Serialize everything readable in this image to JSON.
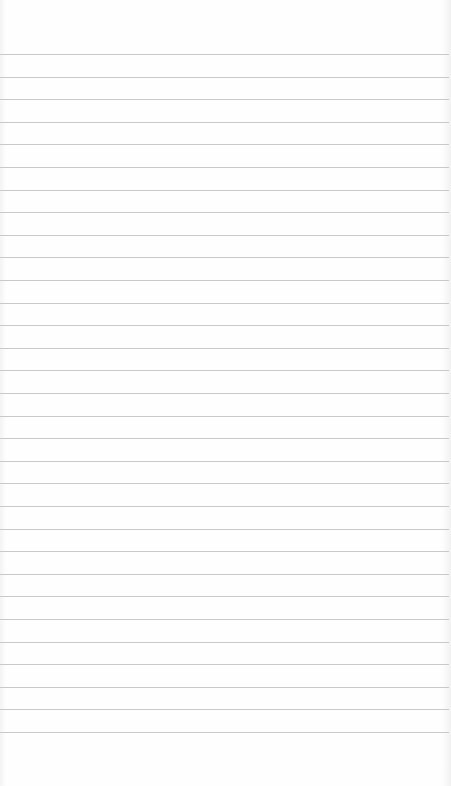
{
  "page": {
    "type": "lined-paper",
    "background_color": "#fdfdfd",
    "line_color": "#c9c9c9",
    "line_count": 31,
    "first_line_y": 54,
    "line_spacing": 22.6
  }
}
